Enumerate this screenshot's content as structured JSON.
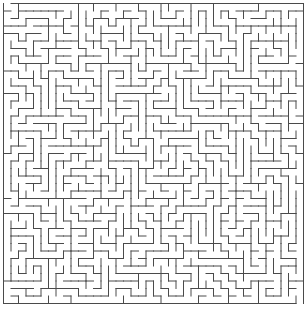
{
  "maze": {
    "title": "Maze",
    "cols": 40,
    "rows": 40,
    "cell_size": 7.5,
    "origin_x": 3.5,
    "origin_y": 3.5,
    "wall_color": "#4a4a4a",
    "background_color": "#ffffff",
    "wall_width": 1,
    "seed": 12345,
    "entrance": {
      "side": "top",
      "col": 0
    },
    "exit": {
      "side": "bottom",
      "col": 39
    }
  }
}
